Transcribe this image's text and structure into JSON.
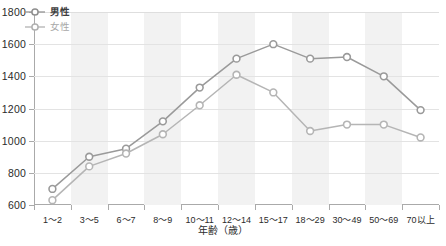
{
  "chart_data": {
    "type": "line",
    "title": "",
    "xlabel": "年齢（歳）",
    "ylabel": "",
    "categories": [
      "1〜2",
      "3〜5",
      "6〜7",
      "8〜9",
      "10〜11",
      "12〜14",
      "15〜17",
      "18〜29",
      "30〜49",
      "50〜69",
      "70以上"
    ],
    "series": [
      {
        "name": "男性",
        "color": "#9a9a9a",
        "values": [
          700,
          900,
          950,
          1120,
          1330,
          1510,
          1600,
          1510,
          1520,
          1400,
          1190
        ]
      },
      {
        "name": "女性",
        "color": "#b5b5b5",
        "values": [
          630,
          840,
          920,
          1040,
          1220,
          1410,
          1300,
          1060,
          1100,
          1100,
          1020
        ]
      }
    ],
    "ylim": [
      600,
      1800
    ],
    "yticks": [
      600,
      800,
      1000,
      1200,
      1400,
      1600,
      1800
    ],
    "ytick_labels": [
      "600",
      "800",
      "1000",
      "1200",
      "1400",
      "1600",
      "1800"
    ],
    "grid": true,
    "legend_position": "top-left",
    "banded_background": true,
    "band_color": "#f2f2f2"
  },
  "legend": {
    "items": [
      {
        "label": "男性"
      },
      {
        "label": "女性"
      }
    ]
  },
  "icons": {
    "male_marker": "circle-marker-icon",
    "female_marker": "circle-marker-icon"
  }
}
